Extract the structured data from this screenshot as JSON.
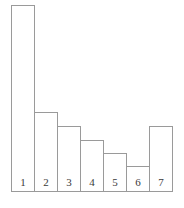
{
  "chart_data": {
    "type": "bar",
    "title": "",
    "subtitle": "",
    "xlabel": "",
    "ylabel": "",
    "grid": false,
    "legend": null,
    "axis_visible": false,
    "baseline_visible": true,
    "categories": [
      "1",
      "2",
      "3",
      "4",
      "5",
      "6",
      "7"
    ],
    "values": [
      187,
      80,
      66,
      52,
      39,
      26,
      66
    ],
    "ylim": [
      0,
      192
    ],
    "bar_labels_inside": true,
    "bar_fill": "none",
    "bar_stroke": "#9a9a9a",
    "background": "#ffffff",
    "label_color": "#3a3a3a",
    "bars": [
      {
        "category": "1",
        "value": 187,
        "label": "1"
      },
      {
        "category": "2",
        "value": 80,
        "label": "2"
      },
      {
        "category": "3",
        "value": 66,
        "label": "3"
      },
      {
        "category": "4",
        "value": 52,
        "label": "4"
      },
      {
        "category": "5",
        "value": 39,
        "label": "5"
      },
      {
        "category": "6",
        "value": 26,
        "label": "6"
      },
      {
        "category": "7",
        "value": 66,
        "label": "7"
      }
    ]
  }
}
